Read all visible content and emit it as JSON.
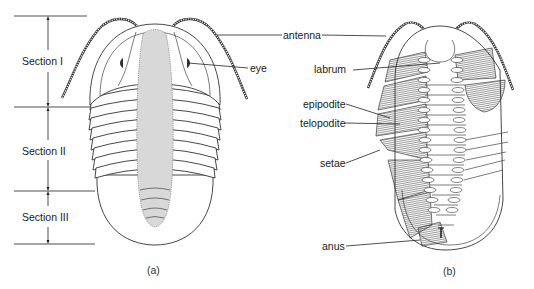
{
  "figure_a": {
    "caption": "(a)",
    "sections": [
      {
        "label": "Section I"
      },
      {
        "label": "Section II"
      },
      {
        "label": "Section III"
      }
    ],
    "labels": {
      "eye": "eye",
      "antenna": "antenna"
    }
  },
  "figure_b": {
    "caption": "(b)",
    "labels": {
      "labrum": "labrum",
      "epipodite": "epipodite",
      "telopodite": "telopodite",
      "setae": "setae",
      "anus": "anus"
    }
  }
}
